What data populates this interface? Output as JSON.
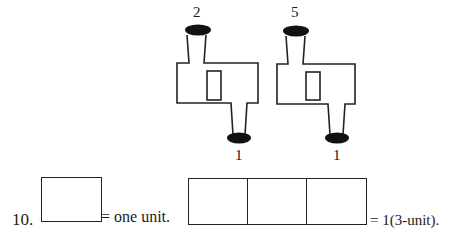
{
  "figure": {
    "shapes": [
      {
        "top_label": "2",
        "bottom_label": "1"
      },
      {
        "top_label": "5",
        "bottom_label": "1"
      }
    ]
  },
  "problem": {
    "number": "10.",
    "one_unit_text": "= one unit.",
    "three_unit_text": "= 1(3-unit)."
  }
}
